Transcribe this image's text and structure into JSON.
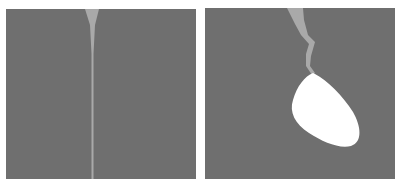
{
  "figure": {
    "panels": [
      {
        "id": "left",
        "description": "narrow vertical crack wedge",
        "background_color": "#6f6f6f",
        "crack_color": "#a9a9a9"
      },
      {
        "id": "right",
        "description": "jagged crack ending in white elliptical cavity",
        "background_color": "#6f6f6f",
        "crack_color": "#a9a9a9",
        "cavity_color": "#ffffff"
      }
    ]
  }
}
